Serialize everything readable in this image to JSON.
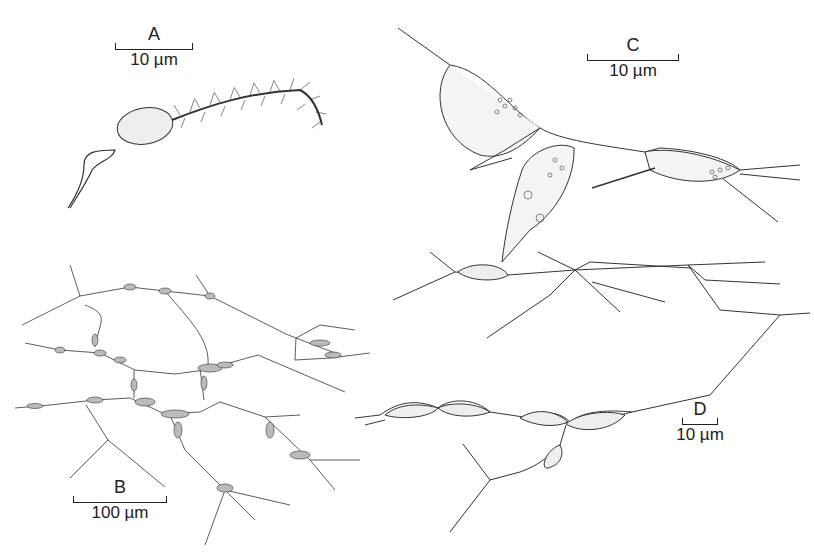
{
  "figure": {
    "panels": [
      {
        "id": "A",
        "label": "A",
        "scale": "10 µm",
        "subject": "single flagellated cell with hairy anterior flagellum"
      },
      {
        "id": "B",
        "label": "B",
        "scale": "100 µm",
        "subject": "network of cells connected by filaments"
      },
      {
        "id": "C",
        "label": "C",
        "scale": "10 µm",
        "subject": "three spindle-shaped cells with granular contents and connecting filaments"
      },
      {
        "id": "D",
        "label": "D",
        "scale": "10 µm",
        "subject": "branching filament network with spindle-shaped cells"
      }
    ],
    "colors": {
      "ink": "#333333",
      "background": "#ffffff",
      "stipple": "#999999"
    }
  }
}
